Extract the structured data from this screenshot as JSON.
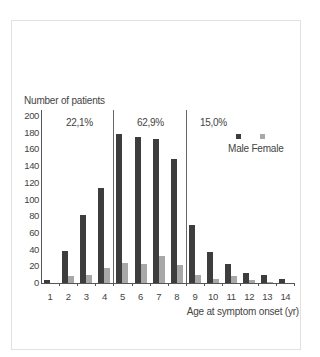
{
  "chart_data": {
    "type": "bar",
    "title": "",
    "ylabel": "Number of patients",
    "xlabel": "Age at symptom onset (yr)",
    "ylim": [
      0,
      200
    ],
    "yticks": [
      0,
      20,
      40,
      60,
      80,
      100,
      120,
      140,
      160,
      180,
      200
    ],
    "categories": [
      "1",
      "2",
      "3",
      "4",
      "5",
      "6",
      "7",
      "8",
      "9",
      "10",
      "11",
      "12",
      "13",
      "14"
    ],
    "series": [
      {
        "name": "Male",
        "color": "#3d3d3d",
        "values": [
          4,
          38,
          82,
          114,
          178,
          175,
          172,
          149,
          70,
          37,
          23,
          12,
          9,
          5
        ]
      },
      {
        "name": "Female",
        "color": "#a8a8a8",
        "values": [
          0,
          8,
          9,
          18,
          24,
          23,
          32,
          22,
          10,
          5,
          8,
          3,
          1,
          0
        ]
      }
    ],
    "legend": {
      "position": "upper right",
      "entries": [
        "Male",
        "Female"
      ]
    },
    "grid": false,
    "annotations": [
      {
        "text": "22.1%",
        "range": "1-4"
      },
      {
        "text": "62.9%",
        "range": "5-8"
      },
      {
        "text": "15.0%",
        "range": "9-14"
      }
    ],
    "dividers_after": [
      "4",
      "8"
    ]
  },
  "labels": {
    "ylabel": "Number of patients",
    "xlabel": "Age at symptom onset (yr)",
    "legend_text": "Male Female",
    "pct1": "22,1%",
    "pct2": "62,9%",
    "pct3": "15,0%"
  }
}
